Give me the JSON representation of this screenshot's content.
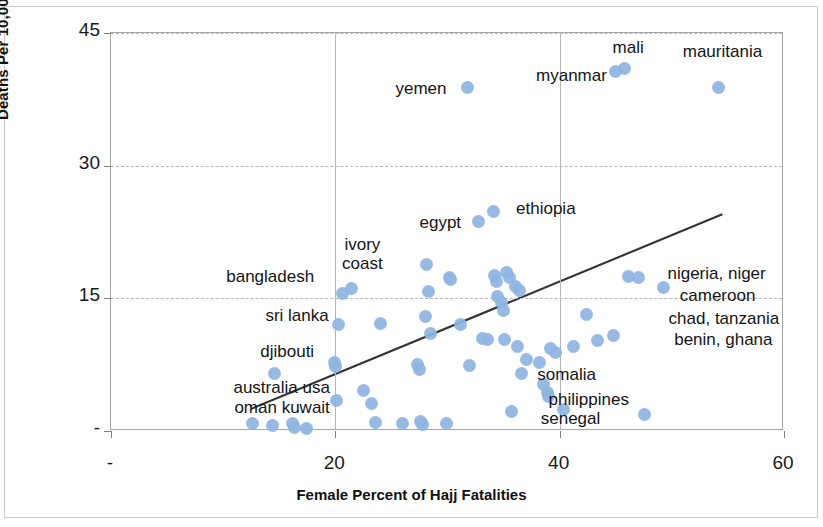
{
  "chart_data": {
    "type": "scatter",
    "title": "",
    "xlabel": "Female Percent of Hajj Fatalities",
    "ylabel": "Deaths Per 10,000 Hajjis",
    "xlim": [
      0,
      60
    ],
    "ylim": [
      0,
      45
    ],
    "xticks": [
      0,
      20,
      40,
      60
    ],
    "xtick_labels": [
      "-",
      "20",
      "40",
      "60"
    ],
    "yticks": [
      0,
      15,
      30,
      45
    ],
    "ytick_labels": [
      "-",
      "15",
      "30",
      "45"
    ],
    "grid": true,
    "legend": "none",
    "point_color": "#8eb4e3",
    "trendline_color": "#333333",
    "trendline": {
      "x0": 12.5,
      "y0": 2.5,
      "x1": 54.5,
      "y1": 24.5
    },
    "points": [
      {
        "x": 12.6,
        "y": 0.8
      },
      {
        "x": 14.4,
        "y": 0.6
      },
      {
        "x": 14.6,
        "y": 6.5
      },
      {
        "x": 16.2,
        "y": 0.9
      },
      {
        "x": 16.4,
        "y": 0.4
      },
      {
        "x": 17.4,
        "y": 0.3
      },
      {
        "x": 19.9,
        "y": 7.8
      },
      {
        "x": 20.0,
        "y": 7.3
      },
      {
        "x": 20.1,
        "y": 3.5
      },
      {
        "x": 20.3,
        "y": 12.0
      },
      {
        "x": 20.6,
        "y": 15.6
      },
      {
        "x": 21.4,
        "y": 16.1
      },
      {
        "x": 22.5,
        "y": 4.6
      },
      {
        "x": 23.2,
        "y": 3.1
      },
      {
        "x": 23.6,
        "y": 1.0
      },
      {
        "x": 24.0,
        "y": 12.2
      },
      {
        "x": 26.0,
        "y": 0.9
      },
      {
        "x": 27.3,
        "y": 7.5
      },
      {
        "x": 27.5,
        "y": 6.9
      },
      {
        "x": 27.6,
        "y": 1.1
      },
      {
        "x": 27.8,
        "y": 0.7
      },
      {
        "x": 28.0,
        "y": 13.0
      },
      {
        "x": 28.1,
        "y": 18.8
      },
      {
        "x": 28.3,
        "y": 15.8
      },
      {
        "x": 28.5,
        "y": 11.0
      },
      {
        "x": 29.9,
        "y": 0.9
      },
      {
        "x": 30.2,
        "y": 17.4
      },
      {
        "x": 30.3,
        "y": 17.1
      },
      {
        "x": 31.2,
        "y": 12.0
      },
      {
        "x": 31.8,
        "y": 38.8
      },
      {
        "x": 32.0,
        "y": 7.4
      },
      {
        "x": 32.8,
        "y": 23.7
      },
      {
        "x": 33.1,
        "y": 10.5
      },
      {
        "x": 33.6,
        "y": 10.4
      },
      {
        "x": 34.1,
        "y": 24.8
      },
      {
        "x": 34.2,
        "y": 17.6
      },
      {
        "x": 34.4,
        "y": 16.9
      },
      {
        "x": 34.5,
        "y": 15.2
      },
      {
        "x": 34.8,
        "y": 14.5
      },
      {
        "x": 35.0,
        "y": 13.6
      },
      {
        "x": 35.1,
        "y": 10.3
      },
      {
        "x": 35.3,
        "y": 17.9
      },
      {
        "x": 35.5,
        "y": 17.4
      },
      {
        "x": 35.7,
        "y": 2.2
      },
      {
        "x": 36.1,
        "y": 16.3
      },
      {
        "x": 36.2,
        "y": 9.6
      },
      {
        "x": 36.4,
        "y": 15.9
      },
      {
        "x": 36.6,
        "y": 6.5
      },
      {
        "x": 37.0,
        "y": 8.1
      },
      {
        "x": 38.2,
        "y": 7.7
      },
      {
        "x": 38.6,
        "y": 5.3
      },
      {
        "x": 38.9,
        "y": 4.4
      },
      {
        "x": 39.0,
        "y": 3.9
      },
      {
        "x": 39.2,
        "y": 9.3
      },
      {
        "x": 39.6,
        "y": 8.9
      },
      {
        "x": 40.3,
        "y": 2.4
      },
      {
        "x": 41.2,
        "y": 9.6
      },
      {
        "x": 42.4,
        "y": 13.2
      },
      {
        "x": 43.4,
        "y": 10.2
      },
      {
        "x": 44.8,
        "y": 10.8
      },
      {
        "x": 45.0,
        "y": 40.6
      },
      {
        "x": 45.8,
        "y": 41.0
      },
      {
        "x": 46.1,
        "y": 17.5
      },
      {
        "x": 47.0,
        "y": 17.4
      },
      {
        "x": 47.6,
        "y": 1.9
      },
      {
        "x": 49.3,
        "y": 16.2
      },
      {
        "x": 54.2,
        "y": 38.8
      }
    ],
    "annotations": [
      {
        "text": "yemen",
        "x": 30.0,
        "y": 38.5,
        "align": "right"
      },
      {
        "text": "myanmar",
        "x": 44.3,
        "y": 40.0,
        "align": "right"
      },
      {
        "text": "mali",
        "x": 46.2,
        "y": 43.2,
        "align": "center"
      },
      {
        "text": "mauritania",
        "x": 54.6,
        "y": 42.7,
        "align": "center"
      },
      {
        "text": "ethiopia",
        "x": 36.2,
        "y": 25.0,
        "align": "left"
      },
      {
        "text": "egypt",
        "x": 31.3,
        "y": 23.4,
        "align": "right"
      },
      {
        "text": "bangladesh",
        "x": 18.2,
        "y": 17.3,
        "align": "right"
      },
      {
        "text": "ivory",
        "x": 22.5,
        "y": 20.9,
        "align": "center"
      },
      {
        "text": "coast",
        "x": 22.5,
        "y": 18.8,
        "align": "center"
      },
      {
        "text": "sri lanka",
        "x": 19.5,
        "y": 12.9,
        "align": "right"
      },
      {
        "text": "djibouti",
        "x": 18.2,
        "y": 8.8,
        "align": "right"
      },
      {
        "text": "australia usa",
        "x": 19.6,
        "y": 4.8,
        "align": "right"
      },
      {
        "text": "oman kuwait",
        "x": 19.6,
        "y": 2.5,
        "align": "right"
      },
      {
        "text": "nigeria, niger",
        "x": 49.7,
        "y": 17.6,
        "align": "left"
      },
      {
        "text": "cameroon",
        "x": 50.8,
        "y": 15.2,
        "align": "left"
      },
      {
        "text": "chad, tanzania",
        "x": 49.8,
        "y": 12.6,
        "align": "left"
      },
      {
        "text": "benin, ghana",
        "x": 50.3,
        "y": 10.2,
        "align": "left"
      },
      {
        "text": "somalia",
        "x": 38.1,
        "y": 6.2,
        "align": "left"
      },
      {
        "text": "philippines",
        "x": 39.1,
        "y": 3.4,
        "align": "left"
      },
      {
        "text": "senegal",
        "x": 38.4,
        "y": 1.3,
        "align": "left"
      }
    ]
  }
}
